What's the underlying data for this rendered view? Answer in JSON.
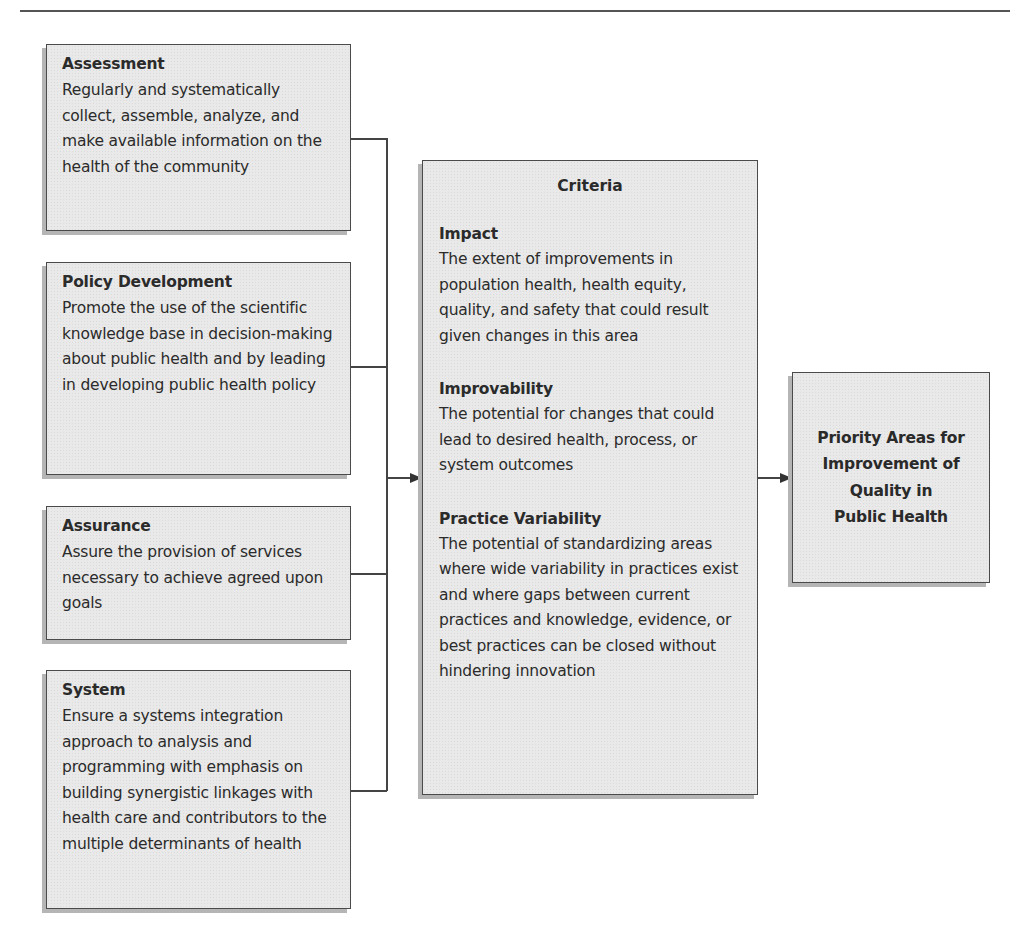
{
  "diagram": {
    "inputs": [
      {
        "title": "Assessment",
        "body": "Regularly and systematically collect, assemble, analyze, and make available information on the health of the community"
      },
      {
        "title": "Policy Development",
        "body": "Promote the use of the scientific knowledge base in decision-making about public health and by leading in developing public health policy"
      },
      {
        "title": "Assurance",
        "body": "Assure the provision of services necessary to achieve agreed upon goals"
      },
      {
        "title": "System",
        "body": "Ensure a systems integration approach to analysis and programming with emphasis on building synergistic linkages with health care and contributors to the multiple determinants of health"
      }
    ],
    "criteria": {
      "heading": "Criteria",
      "items": [
        {
          "title": "Impact",
          "body": "The extent of improvements in population health, health equity, quality, and safety that could result given changes in this area"
        },
        {
          "title": "Improvability",
          "body": "The potential for changes that could lead to desired health, process, or system outcomes"
        },
        {
          "title": "Practice Variability",
          "body": "The potential of standardizing areas where wide variability in practices exist and where gaps between current practices and knowledge, evidence, or best practices can be closed without hindering innovation"
        }
      ]
    },
    "output": {
      "text": "Priority Areas for\nImprovement of\nQuality in\nPublic Health"
    },
    "colors": {
      "box_fill": "#e9e9e9",
      "box_border": "#4a4a4a",
      "shadow": "#b5b5b5",
      "line": "#444444"
    }
  }
}
